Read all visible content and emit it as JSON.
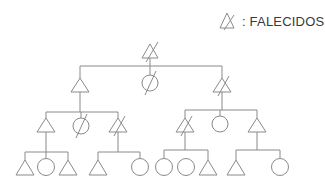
{
  "legend": {
    "symbol": "crossed-triangle-icon",
    "label": ": FALECIDOS"
  },
  "style": {
    "line_color": "#8a8a8a",
    "background": "#ffffff",
    "text_color": "#3a3a3a"
  },
  "tree": {
    "generations": [
      {
        "level": 1,
        "nodes": [
          {
            "id": "g1-a",
            "shape": "triangle",
            "deceased": true,
            "x": 150
          }
        ]
      },
      {
        "level": 2,
        "nodes": [
          {
            "id": "g2-a",
            "shape": "triangle",
            "deceased": false,
            "x": 80
          },
          {
            "id": "g2-b",
            "shape": "circle",
            "deceased": true,
            "x": 150
          },
          {
            "id": "g2-c",
            "shape": "triangle",
            "deceased": true,
            "x": 222
          }
        ]
      },
      {
        "level": 3,
        "nodes": [
          {
            "id": "g3-a",
            "shape": "triangle",
            "deceased": false,
            "x": 46,
            "parent": "g2-a"
          },
          {
            "id": "g3-b",
            "shape": "circle",
            "deceased": true,
            "x": 81,
            "parent": "g2-a"
          },
          {
            "id": "g3-c",
            "shape": "triangle",
            "deceased": true,
            "x": 118,
            "parent": "g2-a"
          },
          {
            "id": "g3-d",
            "shape": "triangle",
            "deceased": true,
            "x": 185,
            "parent": "g2-c"
          },
          {
            "id": "g3-e",
            "shape": "circle",
            "deceased": false,
            "x": 220,
            "parent": "g2-c"
          },
          {
            "id": "g3-f",
            "shape": "triangle",
            "deceased": false,
            "x": 257,
            "parent": "g2-c"
          }
        ]
      },
      {
        "level": 4,
        "nodes": [
          {
            "id": "g4-a",
            "shape": "triangle",
            "deceased": false,
            "x": 25,
            "parent": "g3-a"
          },
          {
            "id": "g4-b",
            "shape": "circle",
            "deceased": false,
            "x": 46,
            "parent": "g3-a"
          },
          {
            "id": "g4-c",
            "shape": "triangle",
            "deceased": false,
            "x": 68,
            "parent": "g3-a"
          },
          {
            "id": "g4-d",
            "shape": "triangle",
            "deceased": false,
            "x": 98,
            "parent": "g3-c"
          },
          {
            "id": "g4-e",
            "shape": "circle",
            "deceased": false,
            "x": 140,
            "parent": "g3-c"
          },
          {
            "id": "g4-f",
            "shape": "circle",
            "deceased": false,
            "x": 164,
            "parent": "g3-d"
          },
          {
            "id": "g4-g",
            "shape": "circle",
            "deceased": false,
            "x": 186,
            "parent": "g3-d"
          },
          {
            "id": "g4-h",
            "shape": "triangle",
            "deceased": false,
            "x": 208,
            "parent": "g3-d"
          },
          {
            "id": "g4-i",
            "shape": "triangle",
            "deceased": false,
            "x": 236,
            "parent": "g3-f"
          },
          {
            "id": "g4-j",
            "shape": "circle",
            "deceased": false,
            "x": 280,
            "parent": "g3-f"
          }
        ]
      }
    ]
  }
}
